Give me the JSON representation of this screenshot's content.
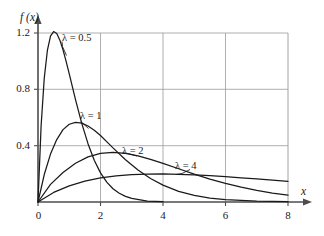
{
  "chart_data": {
    "type": "line",
    "title": "",
    "subtitle": "",
    "xlabel": "x",
    "ylabel": "f (x)",
    "xlim": [
      0,
      8
    ],
    "ylim": [
      0,
      1.35
    ],
    "xticks": [
      "0",
      "2",
      "4",
      "6",
      "8"
    ],
    "xtick_values": [
      0,
      2,
      4,
      6,
      8
    ],
    "yticks": [
      "0.4",
      "0.8",
      "1.2"
    ],
    "ytick_values": [
      0.4,
      0.8,
      1.2
    ],
    "grid": "both",
    "legend_position": "inline-annotations",
    "curve_color": "#1a1a1a",
    "grid_color": "#9a9a9a",
    "axis_color": "#4d4d4d",
    "series": [
      {
        "name": "λ = 0.5",
        "label_lambda": "λ",
        "label_equals": "=",
        "label_value": "0.5",
        "lambda": 0.5,
        "peak_x": 0.5,
        "peak_y": 1.2,
        "x": [
          0,
          0.1,
          0.2,
          0.3,
          0.4,
          0.5,
          0.6,
          0.7,
          0.8,
          0.9,
          1.0,
          1.2,
          1.4,
          1.6,
          1.8,
          2.0,
          2.2,
          2.4,
          2.6,
          2.8,
          3.0,
          3.5,
          4.0
        ],
        "y": [
          0,
          0.543,
          0.879,
          1.076,
          1.178,
          1.21,
          1.196,
          1.149,
          1.08,
          0.999,
          0.91,
          0.727,
          0.558,
          0.414,
          0.297,
          0.207,
          0.141,
          0.094,
          0.062,
          0.04,
          0.026,
          0.007,
          0.002
        ]
      },
      {
        "name": "λ = 1",
        "label_lambda": "λ",
        "label_equals": "=",
        "label_value": "1",
        "lambda": 1,
        "peak_x": 1.0,
        "peak_y": 0.6,
        "x": [
          0,
          0.2,
          0.4,
          0.6,
          0.8,
          1.0,
          1.2,
          1.4,
          1.6,
          1.8,
          2.0,
          2.4,
          2.8,
          3.2,
          3.6,
          4.0,
          4.5,
          5.0,
          5.5,
          6.0,
          7.0,
          8.0
        ],
        "y": [
          0,
          0.195,
          0.34,
          0.443,
          0.514,
          0.552,
          0.565,
          0.56,
          0.54,
          0.51,
          0.472,
          0.384,
          0.3,
          0.227,
          0.167,
          0.12,
          0.076,
          0.047,
          0.028,
          0.017,
          0.006,
          0.002
        ]
      },
      {
        "name": "λ = 2",
        "label_lambda": "λ",
        "label_equals": "=",
        "label_value": "2",
        "lambda": 2,
        "peak_x": 2.0,
        "peak_y": 0.35,
        "x": [
          0,
          0.4,
          0.8,
          1.2,
          1.6,
          2.0,
          2.4,
          2.8,
          3.2,
          3.6,
          4.0,
          4.5,
          5.0,
          5.5,
          6.0,
          6.5,
          7.0,
          7.5,
          8.0
        ],
        "y": [
          0,
          0.125,
          0.21,
          0.275,
          0.32,
          0.345,
          0.352,
          0.345,
          0.327,
          0.303,
          0.274,
          0.236,
          0.198,
          0.163,
          0.132,
          0.105,
          0.082,
          0.063,
          0.048
        ]
      },
      {
        "name": "λ = 4",
        "label_lambda": "λ",
        "label_equals": "=",
        "label_value": "4",
        "lambda": 4,
        "peak_x": 3.8,
        "peak_y": 0.2,
        "x": [
          0,
          0.5,
          1.0,
          1.5,
          2.0,
          2.5,
          3.0,
          3.5,
          4.0,
          4.5,
          5.0,
          5.5,
          6.0,
          6.5,
          7.0,
          7.5,
          8.0
        ],
        "y": [
          0,
          0.068,
          0.115,
          0.148,
          0.171,
          0.185,
          0.194,
          0.198,
          0.199,
          0.197,
          0.193,
          0.187,
          0.18,
          0.172,
          0.164,
          0.155,
          0.147
        ]
      }
    ],
    "annotations": [
      {
        "text": "λ = 0.5",
        "target_x": 0.62,
        "target_y": 1.12
      },
      {
        "text": "λ = 1",
        "target_x": 1.12,
        "target_y": 0.565
      },
      {
        "text": "λ = 2",
        "target_x": 2.55,
        "target_y": 0.345
      },
      {
        "text": "λ = 4",
        "target_x": 4.35,
        "target_y": 0.197
      }
    ]
  },
  "axes": {
    "y_axis_label": "f (x)",
    "y_axis_label_f": "f",
    "y_axis_label_x": "(x)",
    "x_axis_label": "x",
    "ytick_0": "1.2",
    "ytick_1": "0.8",
    "ytick_2": "0.4",
    "xtick_0": "0",
    "xtick_1": "2",
    "xtick_2": "4",
    "xtick_3": "6",
    "xtick_4": "8"
  },
  "labels": {
    "curve0": "λ = 0.5",
    "curve1": "λ = 1",
    "curve2": "λ = 2",
    "curve3": "λ = 4"
  }
}
